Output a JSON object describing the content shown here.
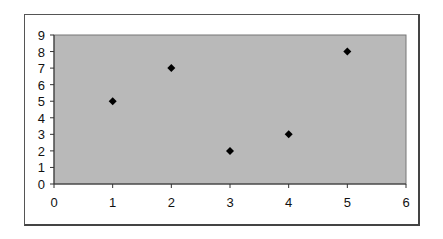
{
  "chart_data": {
    "type": "scatter",
    "title": "",
    "xlabel": "",
    "ylabel": "",
    "x": [
      1,
      2,
      3,
      4,
      5
    ],
    "y": [
      5,
      7,
      2,
      3,
      8
    ],
    "series": [
      {
        "name": "Series 1",
        "x": [
          1,
          2,
          3,
          4,
          5
        ],
        "y": [
          5,
          7,
          2,
          3,
          8
        ],
        "marker": "diamond",
        "color": "#000000"
      }
    ],
    "xlim": [
      0,
      6
    ],
    "ylim": [
      0,
      9
    ],
    "xticks": [
      "0",
      "1",
      "2",
      "3",
      "4",
      "5",
      "6"
    ],
    "yticks": [
      "0",
      "1",
      "2",
      "3",
      "4",
      "5",
      "6",
      "7",
      "8",
      "9"
    ],
    "grid": false,
    "legend": "none",
    "plot_background": "#b9b9b9"
  }
}
